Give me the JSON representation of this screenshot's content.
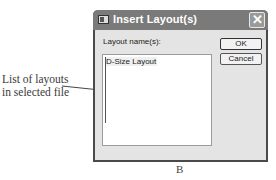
{
  "annotation": {
    "callout_lines": [
      "List of layouts",
      "in selected file"
    ]
  },
  "dialog": {
    "title": "Insert Layout(s)",
    "title_icon": "layout-icon",
    "close_glyph": "✕",
    "label": "Layout name(s):",
    "list_items": [
      "D-Size Layout"
    ],
    "buttons": {
      "ok": "OK",
      "cancel": "Cancel"
    }
  },
  "figure_caption": "B"
}
